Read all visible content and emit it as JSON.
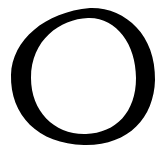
{
  "image": {
    "subject": "hand-drawn circle",
    "background_color": "#ffffff",
    "ink_color": "#000000"
  }
}
